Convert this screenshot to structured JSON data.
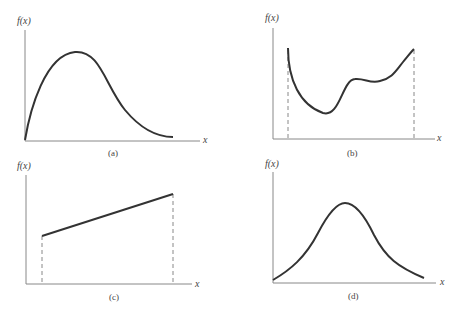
{
  "panels": [
    {
      "id": "a",
      "caption": "(a)",
      "ylabel": "f(x)",
      "xlabel": "x",
      "description": "Right-skewed unimodal density starting at origin"
    },
    {
      "id": "b",
      "caption": "(b)",
      "ylabel": "f(x)",
      "xlabel": "x",
      "description": "Arbitrary function on bounded interval with dashed bounds"
    },
    {
      "id": "c",
      "caption": "(c)",
      "ylabel": "f(x)",
      "xlabel": "x",
      "description": "Linear increasing function on bounded interval with dashed bounds"
    },
    {
      "id": "d",
      "caption": "(d)",
      "ylabel": "f(x)",
      "xlabel": "x",
      "description": "Symmetric bell-shaped curve"
    }
  ],
  "colors": {
    "curve": "#333333",
    "axis": "#777777",
    "dashed": "#888888",
    "text": "#444444"
  }
}
